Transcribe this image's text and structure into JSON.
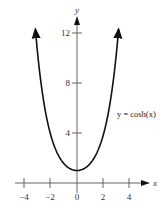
{
  "chart_data": {
    "type": "line",
    "title": "",
    "xlabel": "x",
    "ylabel": "y",
    "xlim": [
      -4.5,
      5
    ],
    "ylim": [
      0,
      13.5
    ],
    "grid": false,
    "x_ticks": [
      -4,
      -2,
      0,
      2,
      4
    ],
    "x_tick_labels": [
      "−4",
      "−2",
      "0",
      "2",
      "4"
    ],
    "y_ticks": [
      4,
      8,
      12
    ],
    "y_tick_labels": [
      "4",
      "8",
      "12"
    ],
    "annotations": [
      {
        "text": "y = cosh(x)",
        "x": 3.1,
        "y": 5.5
      }
    ],
    "series": [
      {
        "name": "y = cosh(x)",
        "x": [
          -3.2,
          -3,
          -2.5,
          -2,
          -1.5,
          -1,
          -0.5,
          0,
          0.5,
          1,
          1.5,
          2,
          2.5,
          3,
          3.2
        ],
        "values": [
          12.29,
          10.07,
          6.13,
          3.76,
          2.35,
          1.54,
          1.13,
          1.0,
          1.13,
          1.54,
          2.35,
          3.76,
          6.13,
          10.07,
          12.29
        ]
      }
    ]
  },
  "labels": {
    "x_axis": "x",
    "y_axis": "y",
    "curve": "y = cosh(x)",
    "xt0": "−4",
    "xt1": "−2",
    "xt2": "0",
    "xt3": "2",
    "xt4": "4",
    "yt0": "4",
    "yt1": "8",
    "yt2": "12"
  }
}
